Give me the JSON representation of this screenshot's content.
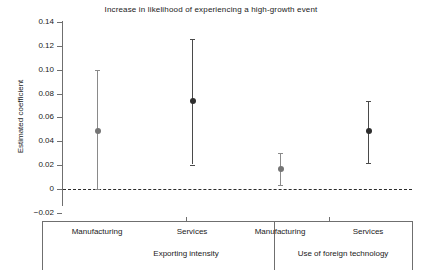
{
  "chart_data": {
    "type": "scatter",
    "title": "Increase in likelihood of experiencing a high-growth event",
    "xlabel": "",
    "ylabel": "Estimated coefficient",
    "ylim": [
      -0.02,
      0.14
    ],
    "yticks": [
      "0.14",
      "0.12",
      "0.10",
      "0.08",
      "0.06",
      "0.04",
      "0.02",
      "0",
      "-0.02"
    ],
    "ytick_values": [
      0.14,
      0.12,
      0.1,
      0.08,
      0.06,
      0.04,
      0.02,
      0,
      -0.02
    ],
    "grid": false,
    "legend": "none",
    "zero_reference_line": 0,
    "categories": [
      "Manufacturing",
      "Services",
      "Manufacturing",
      "Services"
    ],
    "groups": [
      {
        "label": "Exporting intensity",
        "categories": [
          "Manufacturing",
          "Services"
        ]
      },
      {
        "label": "Use of foreign technology",
        "categories": [
          "Manufacturing",
          "Services"
        ]
      }
    ],
    "values": [
      0.049,
      0.0735,
      0.0165,
      0.0485
    ],
    "ci_low": [
      0.0,
      0.0205,
      0.003,
      0.022
    ],
    "ci_high": [
      0.1,
      0.1255,
      0.03,
      0.0735
    ],
    "points": [
      {
        "group": "Exporting intensity",
        "category": "Manufacturing",
        "estimate": 0.049,
        "ci_low": 0.0,
        "ci_high": 0.1,
        "color": "#757575"
      },
      {
        "group": "Exporting intensity",
        "category": "Services",
        "estimate": 0.0735,
        "ci_low": 0.0205,
        "ci_high": 0.1255,
        "color": "#2e2e2e"
      },
      {
        "group": "Use of foreign technology",
        "category": "Manufacturing",
        "estimate": 0.0165,
        "ci_low": 0.003,
        "ci_high": 0.03,
        "color": "#757575"
      },
      {
        "group": "Use of foreign technology",
        "category": "Services",
        "estimate": 0.0485,
        "ci_low": 0.022,
        "ci_high": 0.0735,
        "color": "#2e2e2e"
      }
    ]
  },
  "colors": {
    "axis": "#6f6f6f",
    "text": "#1a1a1a",
    "marker_light": "#757575",
    "marker_dark": "#2e2e2e",
    "zero_line": "#2b2b2b",
    "background": "#ffffff"
  }
}
